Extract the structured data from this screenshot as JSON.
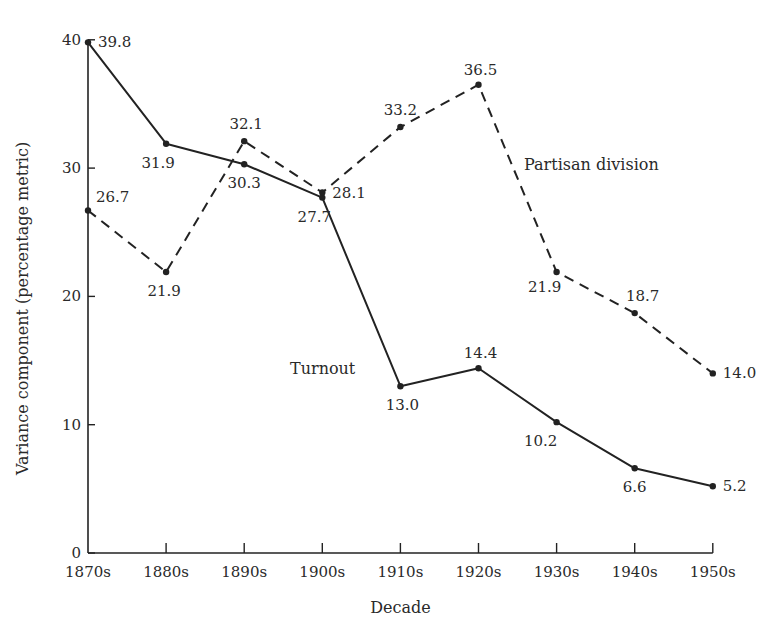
{
  "chart_data": {
    "type": "line",
    "title": "",
    "xlabel": "Decade",
    "ylabel": "Variance component (percentage metric)",
    "ylim": [
      0,
      40
    ],
    "yticks": [
      0,
      10,
      20,
      30,
      40
    ],
    "grid": false,
    "categories": [
      "1870s",
      "1880s",
      "1890s",
      "1900s",
      "1910s",
      "1920s",
      "1930s",
      "1940s",
      "1950s"
    ],
    "series": [
      {
        "name": "Turnout",
        "style": "solid",
        "values": [
          39.8,
          31.9,
          30.3,
          27.7,
          13.0,
          14.4,
          10.2,
          6.6,
          5.2
        ],
        "labels": [
          "39.8",
          "31.9",
          "30.3",
          "27.7",
          "13.0",
          "14.4",
          "10.2",
          "6.6",
          "5.2"
        ]
      },
      {
        "name": "Partisan division",
        "style": "dashed",
        "values": [
          26.7,
          21.9,
          32.1,
          28.1,
          33.2,
          36.5,
          21.9,
          18.7,
          14.0
        ],
        "labels": [
          "26.7",
          "21.9",
          "32.1",
          "28.1",
          "33.2",
          "36.5",
          "21.9",
          "18.7",
          "14.0"
        ]
      }
    ],
    "legend": "inline series labels"
  }
}
